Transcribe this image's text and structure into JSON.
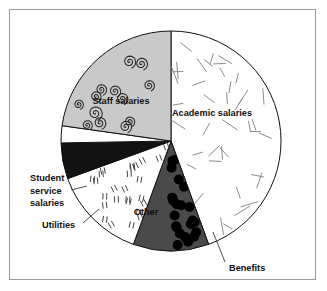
{
  "figure": {
    "frame_color": "#9a9a9a",
    "background": "#ffffff"
  },
  "chart_data": {
    "type": "pie",
    "title": "",
    "subtitle": "",
    "xlabel": "",
    "ylabel": "",
    "legend_position": "none",
    "grid": false,
    "labels_inside": [
      "Staff salaries",
      "Academic salaries",
      "Other"
    ],
    "labels_callout": [
      "Student service salaries",
      "Utilities",
      "Benefits"
    ],
    "start_angle_deg": 0,
    "direction": "clockwise",
    "categories": [
      "Academic salaries",
      "Benefits",
      "Other",
      "Utilities",
      "Student service salaries",
      "Staff salaries"
    ],
    "values": [
      44.4,
      11.1,
      13.9,
      5.3,
      2.5,
      22.8
    ],
    "units": "percent",
    "slices": [
      {
        "name": "Academic salaries",
        "label": "Academic salaries",
        "value": 44.4,
        "start_deg": 0,
        "end_deg": 160,
        "fill": "#ffffff",
        "stroke": "#111111",
        "pattern": "short-dashes",
        "pattern_color": "#8a8a8a",
        "label_placement": "inside",
        "label_x": 212,
        "label_y": 116
      },
      {
        "name": "Benefits",
        "label": "Benefits",
        "value": 11.1,
        "start_deg": 160,
        "end_deg": 200,
        "fill": "#4a4a4a",
        "stroke": "#111111",
        "pattern": "large-dots",
        "pattern_color": "#000000",
        "label_placement": "callout",
        "label_x": 229,
        "label_y": 271,
        "leader": [
          [
            213,
            232
          ],
          [
            225,
            262
          ]
        ]
      },
      {
        "name": "Other",
        "label": "Other",
        "value": 13.9,
        "start_deg": 200,
        "end_deg": 250,
        "fill": "#ffffff",
        "stroke": "#111111",
        "pattern": "double-dashes",
        "pattern_color": "#3a3a3a",
        "label_placement": "inside",
        "label_x": 146,
        "label_y": 215
      },
      {
        "name": "Utilities",
        "label": "Utilities",
        "value": 5.3,
        "start_deg": 250,
        "end_deg": 269,
        "fill": "#121212",
        "stroke": "#111111",
        "pattern": "solid",
        "pattern_color": "#121212",
        "label_placement": "callout",
        "label_x": 42,
        "label_y": 228,
        "leader": [
          [
            99,
            209
          ],
          [
            83,
            223
          ]
        ]
      },
      {
        "name": "Student service salaries",
        "label": "Student service salaries",
        "value": 2.5,
        "start_deg": 269,
        "end_deg": 278,
        "fill": "#ffffff",
        "stroke": "#111111",
        "pattern": "none",
        "pattern_color": "#ffffff",
        "label_placement": "callout",
        "label_lines": [
          "Student",
          "service",
          "salaries"
        ],
        "label_x": 30,
        "label_y": 181,
        "leader": [
          [
            87,
            186
          ],
          [
            71,
            190
          ]
        ]
      },
      {
        "name": "Staff salaries",
        "label": "Staff salaries",
        "value": 22.8,
        "start_deg": 278,
        "end_deg": 360,
        "fill": "#c9c9c9",
        "stroke": "#111111",
        "pattern": "spirals",
        "pattern_color": "#2a2a2a",
        "label_placement": "inside",
        "label_x": 121,
        "label_y": 104
      }
    ],
    "geometry": {
      "center_x": 171,
      "center_y": 141,
      "radius": 110
    }
  }
}
